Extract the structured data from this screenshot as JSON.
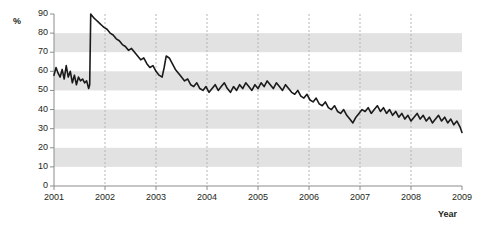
{
  "chart_data": {
    "type": "line",
    "title": "",
    "subtitle": "",
    "xlabel": "Year",
    "ylabel": "%",
    "xlim": [
      2001,
      2009
    ],
    "ylim": [
      0,
      90
    ],
    "yticks": [
      0,
      10,
      20,
      30,
      40,
      50,
      60,
      70,
      80,
      90
    ],
    "ytick_labels": [
      "0",
      "10",
      "20",
      "30",
      "40",
      "50",
      "60",
      "70",
      "80",
      "90"
    ],
    "xticks": [
      2001,
      2002,
      2003,
      2004,
      2005,
      2006,
      2007,
      2008,
      2009
    ],
    "xtick_labels": [
      "2001",
      "2002",
      "2003",
      "2004",
      "2005",
      "2006",
      "2007",
      "2008",
      "2009"
    ],
    "grid": "horizontal-bands-and-vertical-dashed",
    "legend": "none",
    "line_color": "#1a1a1a",
    "band_color": "#e2e2e2",
    "axis_color": "#8c8c8c",
    "series": [
      {
        "name": "percent",
        "x": [
          2001.0,
          2001.04,
          2001.08,
          2001.12,
          2001.16,
          2001.2,
          2001.24,
          2001.28,
          2001.32,
          2001.36,
          2001.4,
          2001.44,
          2001.48,
          2001.52,
          2001.56,
          2001.6,
          2001.64,
          2001.68,
          2001.7,
          2001.72,
          2001.75,
          2001.78,
          2001.82,
          2001.86,
          2001.9,
          2001.94,
          2001.98,
          2002.04,
          2002.1,
          2002.16,
          2002.22,
          2002.28,
          2002.34,
          2002.4,
          2002.46,
          2002.52,
          2002.58,
          2002.64,
          2002.7,
          2002.76,
          2002.82,
          2002.88,
          2002.94,
          2003.0,
          2003.06,
          2003.12,
          2003.16,
          2003.2,
          2003.26,
          2003.32,
          2003.38,
          2003.44,
          2003.5,
          2003.56,
          2003.62,
          2003.68,
          2003.74,
          2003.8,
          2003.86,
          2003.92,
          2003.98,
          2004.04,
          2004.1,
          2004.16,
          2004.22,
          2004.28,
          2004.34,
          2004.4,
          2004.46,
          2004.52,
          2004.58,
          2004.64,
          2004.7,
          2004.76,
          2004.82,
          2004.88,
          2004.94,
          2005.0,
          2005.06,
          2005.12,
          2005.18,
          2005.24,
          2005.3,
          2005.36,
          2005.42,
          2005.48,
          2005.54,
          2005.6,
          2005.66,
          2005.72,
          2005.78,
          2005.84,
          2005.9,
          2005.96,
          2006.02,
          2006.08,
          2006.14,
          2006.2,
          2006.26,
          2006.32,
          2006.38,
          2006.44,
          2006.5,
          2006.56,
          2006.62,
          2006.68,
          2006.74,
          2006.8,
          2006.86,
          2006.92,
          2006.98,
          2007.04,
          2007.1,
          2007.16,
          2007.22,
          2007.28,
          2007.34,
          2007.4,
          2007.46,
          2007.52,
          2007.58,
          2007.64,
          2007.7,
          2007.76,
          2007.82,
          2007.88,
          2007.94,
          2008.0,
          2008.06,
          2008.12,
          2008.18,
          2008.24,
          2008.3,
          2008.36,
          2008.42,
          2008.48,
          2008.54,
          2008.6,
          2008.66,
          2008.72,
          2008.78,
          2008.84,
          2008.9,
          2008.96,
          2009.0
        ],
        "values": [
          58,
          62,
          59,
          57,
          61,
          56,
          63,
          57,
          60,
          54,
          58,
          53,
          57,
          55,
          56,
          54,
          55,
          51,
          53,
          90,
          89,
          88,
          87,
          86,
          85,
          84,
          83,
          82,
          80,
          79,
          77,
          76,
          74,
          73,
          71,
          72,
          70,
          68,
          66,
          67,
          64,
          62,
          63,
          60,
          58,
          57,
          62,
          68,
          67,
          64,
          61,
          59,
          57,
          55,
          56,
          53,
          52,
          54,
          51,
          50,
          52,
          49,
          51,
          53,
          50,
          52,
          54,
          51,
          49,
          52,
          50,
          53,
          51,
          54,
          52,
          50,
          53,
          51,
          54,
          52,
          55,
          53,
          51,
          54,
          52,
          50,
          53,
          51,
          49,
          48,
          50,
          47,
          46,
          48,
          45,
          44,
          46,
          43,
          42,
          44,
          41,
          40,
          42,
          39,
          38,
          40,
          37,
          35,
          33,
          36,
          38,
          40,
          39,
          41,
          38,
          40,
          42,
          39,
          41,
          38,
          40,
          37,
          39,
          36,
          38,
          35,
          37,
          34,
          36,
          38,
          35,
          37,
          34,
          36,
          33,
          35,
          37,
          34,
          36,
          33,
          35,
          32,
          34,
          31,
          28
        ]
      }
    ]
  }
}
